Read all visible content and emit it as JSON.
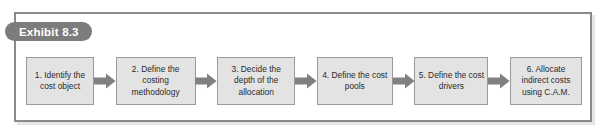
{
  "exhibit": {
    "badge_label": "Exhibit 8.3",
    "badge_color": "#7c7c7c",
    "badge_text_color": "#ffffff",
    "frame_border_color": "#8a8a8a",
    "background_color": "#ffffff"
  },
  "diagram": {
    "type": "process-flow",
    "orientation": "horizontal",
    "box_fill_color": "#e3e3e3",
    "box_border_color": "#9a9a9a",
    "text_color": "#2b2b2b",
    "arrow_color": "#808080",
    "steps": [
      {
        "number": "1.",
        "label": "1. Identify the cost object"
      },
      {
        "number": "2.",
        "label": "2. Define the costing methodology"
      },
      {
        "number": "3.",
        "label": "3. Decide the depth of the allocation"
      },
      {
        "number": "4.",
        "label": "4. Define the cost pools"
      },
      {
        "number": "5.",
        "label": "5. Define the cost drivers"
      },
      {
        "number": "6.",
        "label": "6. Allocate indirect costs using C.A.M."
      }
    ],
    "connector_count": 5,
    "connector_icon": "right-block-arrow-icon"
  }
}
